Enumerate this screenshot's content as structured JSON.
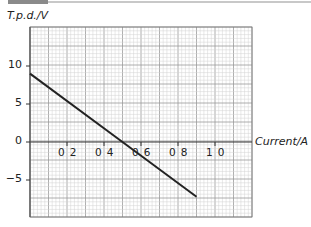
{
  "header": {
    "bar_colors": {
      "dark": "#8a8a8a",
      "light": "#c8c8c8"
    }
  },
  "chart_data": {
    "type": "line",
    "title": "",
    "xlabel": "Current / A",
    "ylabel": "T.p.d. / V",
    "xlim": [
      0,
      1.2
    ],
    "ylim": [
      -10,
      15
    ],
    "x_ticks": [
      0.2,
      0.4,
      0.6,
      0.8,
      1.0
    ],
    "x_tick_labels": [
      "0 2",
      "0 4",
      "0 6",
      "0 8",
      "1 0"
    ],
    "y_ticks": [
      10,
      5,
      0,
      -5
    ],
    "y_tick_labels": [
      "10",
      "5",
      "0",
      "−5"
    ],
    "grid": true,
    "series": [
      {
        "name": "t.p.d. vs current",
        "x": [
          0,
          0.5,
          0.9
        ],
        "y": [
          9,
          0,
          -7.2
        ],
        "color": "#222222"
      }
    ],
    "legend": null
  },
  "labels": {
    "y_axis": "T.p.d./V",
    "x_axis": "Current/A"
  }
}
